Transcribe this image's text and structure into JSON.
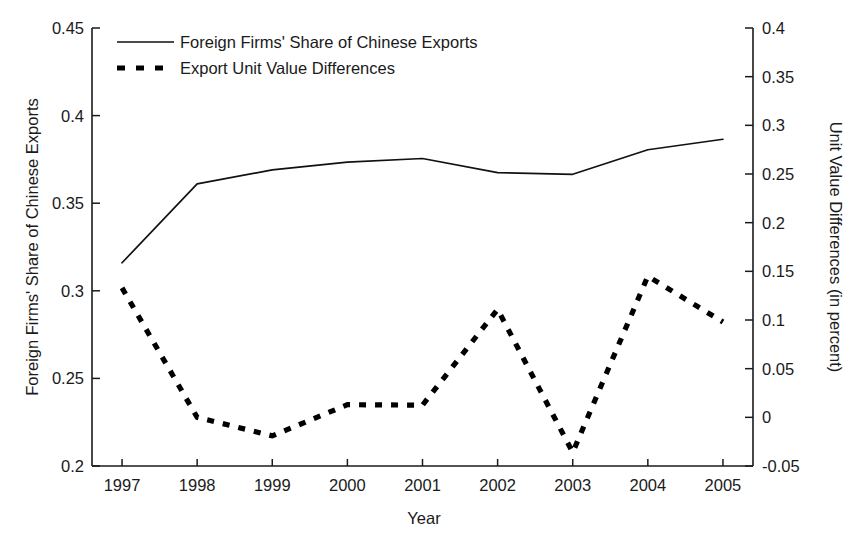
{
  "chart_data": {
    "type": "line",
    "title": "",
    "xlabel": "Year",
    "ylabel": "Foreign Firms' Share of Chinese Exports",
    "y2label": "Unit Value Differences (in percent)",
    "x": [
      1997,
      1998,
      1999,
      2000,
      2001,
      2002,
      2003,
      2004,
      2005
    ],
    "xtick_labels": [
      "1997",
      "1998",
      "1999",
      "2000",
      "2001",
      "2002",
      "2003",
      "2004",
      "2005"
    ],
    "xlim": [
      1996.6,
      2005.4
    ],
    "ylim": [
      0.2,
      0.45
    ],
    "ytick_labels": [
      "0.2",
      "0.25",
      "0.3",
      "0.35",
      "0.4",
      "0.45"
    ],
    "ytick_values": [
      0.2,
      0.25,
      0.3,
      0.35,
      0.4,
      0.45
    ],
    "y2lim": [
      -0.05,
      0.4
    ],
    "y2tick_labels": [
      "-0.05",
      "0",
      "0.05",
      "0.1",
      "0.15",
      "0.2",
      "0.25",
      "0.3",
      "0.35",
      "0.4"
    ],
    "y2tick_values": [
      -0.05,
      0,
      0.05,
      0.1,
      0.15,
      0.2,
      0.25,
      0.3,
      0.35,
      0.4
    ],
    "grid": false,
    "legend_position": "top-left",
    "series": [
      {
        "name": "Foreign Firms' Share of Chinese Exports",
        "axis": "left",
        "style": "solid",
        "values": [
          0.316,
          0.361,
          0.369,
          0.3735,
          0.3755,
          0.3675,
          0.3665,
          0.3805,
          0.3865
        ]
      },
      {
        "name": "Export Unit Value Differences",
        "axis": "right",
        "style": "dashed",
        "values": [
          0.133,
          0.0,
          -0.019,
          0.013,
          0.0125,
          0.111,
          -0.036,
          0.145,
          0.098
        ]
      }
    ]
  },
  "legend": {
    "entries": [
      {
        "label": "Foreign Firms' Share of Chinese Exports",
        "style": "solid"
      },
      {
        "label": "Export Unit Value Differences",
        "style": "dashed"
      }
    ]
  },
  "colors": {
    "axis": "#1a1a1a",
    "series_solid": "#111111",
    "series_dashed": "#000000",
    "background": "#ffffff"
  }
}
